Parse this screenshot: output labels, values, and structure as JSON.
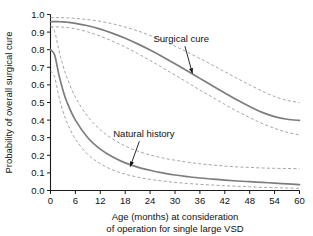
{
  "chart_data": {
    "type": "line",
    "title": "",
    "xlabel": "Age (months) at consideration of operation for single large VSD",
    "xlabel_line1": "Age (months) at consideration",
    "xlabel_line2": "of operation for single large VSD",
    "ylabel": "Probability of overall surgical cure",
    "xlim": [
      0,
      60
    ],
    "ylim": [
      0.0,
      1.0
    ],
    "grid": false,
    "legend": "none",
    "x_ticks": [
      0,
      6,
      12,
      18,
      24,
      30,
      36,
      42,
      48,
      54,
      60
    ],
    "x_tick_labels": [
      "0",
      "6",
      "12",
      "18",
      "24",
      "30",
      "36",
      "42",
      "48",
      "54",
      "60"
    ],
    "y_ticks": [
      0.0,
      0.1,
      0.2,
      0.3,
      0.4,
      0.5,
      0.6,
      0.7,
      0.8,
      0.9,
      1.0
    ],
    "y_tick_labels": [
      "0.0",
      "0.1",
      "0.2",
      "0.3",
      "0.4",
      "0.5",
      "0.6",
      "0.7",
      "0.8",
      "0.9",
      "1.0"
    ],
    "x": [
      0,
      1,
      2,
      3,
      4,
      6,
      9,
      12,
      15,
      18,
      21,
      24,
      27,
      30,
      33,
      36,
      39,
      42,
      45,
      48,
      51,
      54,
      57,
      60
    ],
    "series": [
      {
        "name": "Surgical cure",
        "style": "solid",
        "color": "#7d7d7d",
        "values": [
          0.96,
          0.96,
          0.959,
          0.958,
          0.956,
          0.95,
          0.936,
          0.917,
          0.893,
          0.865,
          0.833,
          0.798,
          0.76,
          0.72,
          0.679,
          0.637,
          0.595,
          0.554,
          0.514,
          0.477,
          0.444,
          0.42,
          0.405,
          0.398
        ]
      },
      {
        "name": "Surgical cure upper 70% confidence limit",
        "style": "dashed",
        "color": "#9b9b9b",
        "values": [
          0.983,
          0.983,
          0.982,
          0.982,
          0.981,
          0.978,
          0.971,
          0.961,
          0.947,
          0.929,
          0.907,
          0.881,
          0.852,
          0.82,
          0.786,
          0.75,
          0.713,
          0.675,
          0.637,
          0.6,
          0.565,
          0.534,
          0.512,
          0.5
        ]
      },
      {
        "name": "Surgical cure lower 70% confidence limit",
        "style": "dashed",
        "color": "#9b9b9b",
        "values": [
          0.93,
          0.93,
          0.929,
          0.928,
          0.926,
          0.919,
          0.901,
          0.877,
          0.848,
          0.815,
          0.778,
          0.739,
          0.698,
          0.656,
          0.614,
          0.571,
          0.53,
          0.489,
          0.45,
          0.414,
          0.381,
          0.353,
          0.331,
          0.315
        ]
      },
      {
        "name": "Natural history",
        "style": "solid",
        "color": "#6e6e6e",
        "values": [
          0.8,
          0.77,
          0.66,
          0.57,
          0.5,
          0.4,
          0.3,
          0.235,
          0.19,
          0.157,
          0.133,
          0.115,
          0.1,
          0.088,
          0.079,
          0.071,
          0.065,
          0.059,
          0.054,
          0.05,
          0.046,
          0.042,
          0.038,
          0.033
        ]
      },
      {
        "name": "Natural history upper 70% confidence limit",
        "style": "dashed",
        "color": "#9b9b9b",
        "values": [
          0.935,
          0.905,
          0.8,
          0.71,
          0.64,
          0.53,
          0.42,
          0.345,
          0.292,
          0.253,
          0.224,
          0.202,
          0.185,
          0.172,
          0.161,
          0.152,
          0.145,
          0.139,
          0.134,
          0.131,
          0.128,
          0.126,
          0.125,
          0.124
        ]
      },
      {
        "name": "Natural history lower 70% confidence limit",
        "style": "dashed",
        "color": "#9b9b9b",
        "values": [
          0.68,
          0.645,
          0.535,
          0.45,
          0.385,
          0.292,
          0.205,
          0.152,
          0.117,
          0.093,
          0.076,
          0.063,
          0.054,
          0.046,
          0.04,
          0.035,
          0.031,
          0.027,
          0.024,
          0.021,
          0.018,
          0.016,
          0.014,
          0.012
        ]
      }
    ],
    "annotations": [
      {
        "text": "Surgical cure",
        "label_x": 31.5,
        "label_y": 0.845,
        "point_x": 34.2,
        "point_y": 0.665
      },
      {
        "text": "Natural history",
        "label_x": 22.5,
        "label_y": 0.305,
        "point_x": 19.2,
        "point_y": 0.135
      }
    ]
  }
}
